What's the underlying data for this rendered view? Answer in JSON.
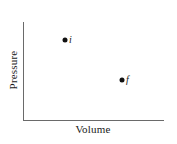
{
  "diagram": {
    "type": "pv-diagram",
    "axes": {
      "x_label": "Volume",
      "y_label": "Pressure",
      "color": "#6a6a6a"
    },
    "points": [
      {
        "id": "i",
        "label": "i",
        "x": 65,
        "y": 40,
        "description": "initial state (higher pressure, lower volume)"
      },
      {
        "id": "f",
        "label": "f",
        "x": 122,
        "y": 80,
        "description": "final state (lower pressure, higher volume)"
      }
    ],
    "point_color": "#111111"
  }
}
